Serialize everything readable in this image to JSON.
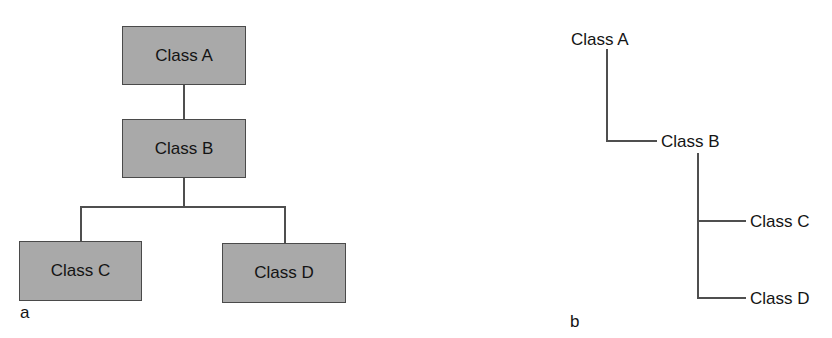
{
  "figure": {
    "panel_a": {
      "label": "a",
      "style": "box hierarchy",
      "nodes": [
        {
          "id": "A",
          "label": "Class A"
        },
        {
          "id": "B",
          "label": "Class B"
        },
        {
          "id": "C",
          "label": "Class C"
        },
        {
          "id": "D",
          "label": "Class D"
        }
      ],
      "edges": [
        [
          "A",
          "B"
        ],
        [
          "B",
          "C"
        ],
        [
          "B",
          "D"
        ]
      ],
      "box_fill": "#a9a9a9",
      "border_color": "#4a4a4a"
    },
    "panel_b": {
      "label": "b",
      "style": "indented tree",
      "nodes": [
        {
          "id": "A",
          "label": "Class A"
        },
        {
          "id": "B",
          "label": "Class B"
        },
        {
          "id": "C",
          "label": "Class C"
        },
        {
          "id": "D",
          "label": "Class D"
        }
      ],
      "edges": [
        [
          "A",
          "B"
        ],
        [
          "B",
          "C"
        ],
        [
          "B",
          "D"
        ]
      ],
      "line_color": "#4f4f4f"
    }
  }
}
